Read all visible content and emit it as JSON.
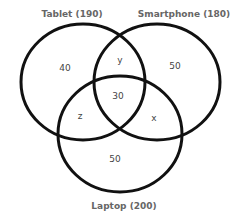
{
  "diagram": {
    "type": "venn",
    "sets": [
      {
        "name": "Tablet",
        "total": 190,
        "label": "Tablet (190)"
      },
      {
        "name": "Smartphone",
        "total": 180,
        "label": "Smartphone (180)"
      },
      {
        "name": "Laptop",
        "total": 200,
        "label": "Laptop (200)"
      }
    ],
    "regions": {
      "tablet_only": "40",
      "smartphone_only": "50",
      "laptop_only": "50",
      "tablet_smartphone_only": "y",
      "tablet_laptop_only": "z",
      "smartphone_laptop_only": "x",
      "all_three": "30"
    },
    "colors": {
      "stroke": "#111111",
      "text": "#555555",
      "background": "#ffffff"
    }
  }
}
